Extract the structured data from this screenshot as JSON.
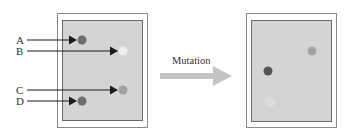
{
  "diagram": {
    "arrow_label": "Mutation",
    "left_panel": {
      "spots": [
        {
          "label": "A",
          "x": 82,
          "y": 40,
          "color": "#6e6e6e"
        },
        {
          "label": "B",
          "x": 123,
          "y": 51,
          "color": "#eeeeee"
        },
        {
          "label": "C",
          "x": 123,
          "y": 90,
          "color": "#a3a3a3"
        },
        {
          "label": "D",
          "x": 82,
          "y": 101,
          "color": "#6e6e6e"
        }
      ]
    },
    "right_panel": {
      "spots": [
        {
          "x": 312,
          "y": 51,
          "color": "#a3a3a3"
        },
        {
          "x": 268,
          "y": 71,
          "color": "#555555"
        },
        {
          "x": 270,
          "y": 102,
          "color": "#dcdcdc"
        }
      ]
    },
    "colors": {
      "frame_border": "#8a8a8a",
      "panel_fill": "#d4d4d4",
      "panel_border": "#6a6a6a",
      "arrow_fill": "#c4c4c4",
      "pointer": "#1a1a1a"
    }
  }
}
